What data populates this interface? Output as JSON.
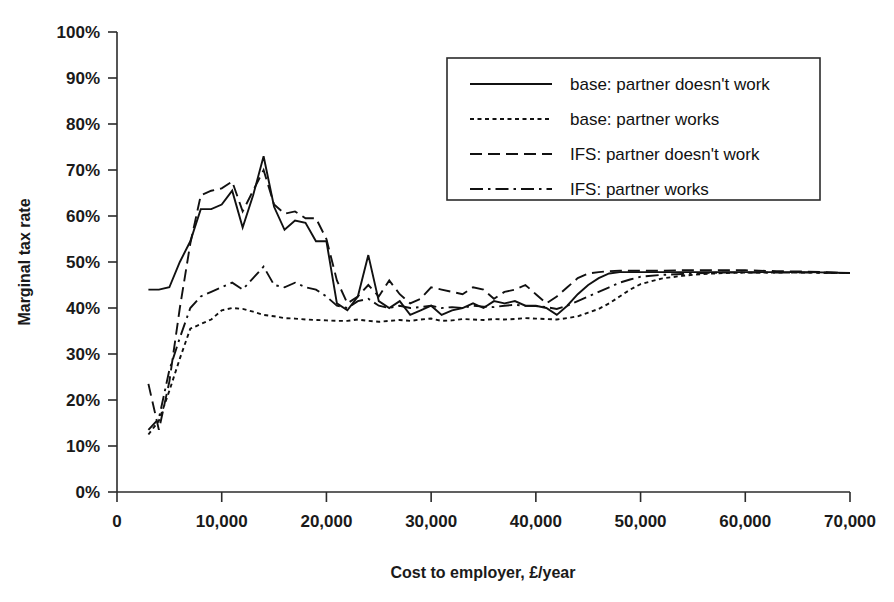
{
  "chart_data": {
    "type": "line",
    "title": "",
    "xlabel": "Cost to employer, £/year",
    "ylabel": "Marginal tax rate",
    "xlim": [
      0,
      70000
    ],
    "ylim": [
      0,
      1.0
    ],
    "grid": false,
    "legend_position": "top-right",
    "x_ticks": [
      0,
      10000,
      20000,
      30000,
      40000,
      50000,
      60000,
      70000
    ],
    "x_tick_labels": [
      "0",
      "10,000",
      "20,000",
      "30,000",
      "40,000",
      "50,000",
      "60,000",
      "70,000"
    ],
    "y_ticks": [
      0,
      0.1,
      0.2,
      0.3,
      0.4,
      0.5,
      0.6,
      0.7,
      0.8,
      0.9,
      1.0
    ],
    "y_tick_labels": [
      "0%",
      "10%",
      "20%",
      "30%",
      "40%",
      "50%",
      "60%",
      "70%",
      "80%",
      "90%",
      "100%"
    ],
    "series": [
      {
        "name": "base: partner doesn't work",
        "dash": "solid",
        "x": [
          3000,
          4000,
          5000,
          6000,
          7000,
          8000,
          9000,
          10000,
          11000,
          12000,
          13000,
          14000,
          15000,
          16000,
          17000,
          18000,
          19000,
          20000,
          21000,
          22000,
          23000,
          24000,
          25000,
          26000,
          27000,
          28000,
          29000,
          30000,
          31000,
          32000,
          33000,
          34000,
          35000,
          36000,
          37000,
          38000,
          39000,
          40000,
          41000,
          42000,
          43000,
          44000,
          45000,
          46000,
          47000,
          48000,
          49000,
          50000,
          52000,
          54000,
          56000,
          58000,
          60000,
          63000,
          66000,
          70000
        ],
        "y": [
          0.44,
          0.44,
          0.445,
          0.5,
          0.545,
          0.615,
          0.615,
          0.625,
          0.655,
          0.575,
          0.645,
          0.73,
          0.62,
          0.57,
          0.59,
          0.585,
          0.545,
          0.545,
          0.41,
          0.395,
          0.425,
          0.515,
          0.415,
          0.4,
          0.415,
          0.385,
          0.395,
          0.405,
          0.385,
          0.395,
          0.4,
          0.41,
          0.4,
          0.415,
          0.41,
          0.415,
          0.405,
          0.405,
          0.4,
          0.385,
          0.405,
          0.43,
          0.45,
          0.465,
          0.475,
          0.478,
          0.478,
          0.478,
          0.478,
          0.478,
          0.478,
          0.478,
          0.478,
          0.478,
          0.478,
          0.476
        ]
      },
      {
        "name": "base: partner works",
        "dash": "dotted",
        "x": [
          3000,
          4000,
          5000,
          6000,
          7000,
          8000,
          9000,
          10000,
          11000,
          12000,
          13000,
          14000,
          15000,
          16000,
          17000,
          18000,
          19000,
          20000,
          21000,
          22000,
          23000,
          24000,
          25000,
          26000,
          27000,
          28000,
          29000,
          30000,
          31000,
          32000,
          33000,
          34000,
          35000,
          36000,
          37000,
          38000,
          39000,
          40000,
          41000,
          42000,
          43000,
          44000,
          45000,
          46000,
          47000,
          48000,
          49000,
          50000,
          52000,
          54000,
          56000,
          58000,
          60000,
          63000,
          66000,
          70000
        ],
        "y": [
          0.125,
          0.155,
          0.22,
          0.29,
          0.355,
          0.365,
          0.375,
          0.395,
          0.4,
          0.398,
          0.392,
          0.385,
          0.382,
          0.378,
          0.377,
          0.375,
          0.374,
          0.373,
          0.372,
          0.372,
          0.375,
          0.372,
          0.37,
          0.372,
          0.374,
          0.372,
          0.375,
          0.377,
          0.372,
          0.373,
          0.376,
          0.375,
          0.374,
          0.376,
          0.375,
          0.376,
          0.378,
          0.377,
          0.376,
          0.375,
          0.378,
          0.382,
          0.39,
          0.398,
          0.41,
          0.425,
          0.44,
          0.452,
          0.464,
          0.47,
          0.474,
          0.476,
          0.477,
          0.477,
          0.477,
          0.476
        ]
      },
      {
        "name": "IFS: partner doesn't work",
        "dash": "dashed",
        "x": [
          3000,
          4000,
          5000,
          6000,
          7000,
          8000,
          9000,
          10000,
          11000,
          12000,
          13000,
          14000,
          15000,
          16000,
          17000,
          18000,
          19000,
          20000,
          21000,
          22000,
          23000,
          24000,
          25000,
          26000,
          27000,
          28000,
          29000,
          30000,
          31000,
          32000,
          33000,
          34000,
          35000,
          36000,
          37000,
          38000,
          39000,
          40000,
          41000,
          42000,
          43000,
          44000,
          45000,
          46000,
          47000,
          48000,
          49000,
          50000,
          52000,
          54000,
          56000,
          58000,
          60000,
          63000,
          66000,
          70000
        ],
        "y": [
          0.235,
          0.135,
          0.24,
          0.4,
          0.54,
          0.645,
          0.655,
          0.66,
          0.675,
          0.61,
          0.655,
          0.7,
          0.625,
          0.605,
          0.61,
          0.595,
          0.595,
          0.55,
          0.46,
          0.41,
          0.425,
          0.45,
          0.425,
          0.46,
          0.43,
          0.41,
          0.42,
          0.445,
          0.44,
          0.435,
          0.43,
          0.445,
          0.44,
          0.42,
          0.435,
          0.44,
          0.45,
          0.43,
          0.41,
          0.425,
          0.445,
          0.465,
          0.475,
          0.478,
          0.48,
          0.481,
          0.481,
          0.481,
          0.481,
          0.482,
          0.482,
          0.482,
          0.482,
          0.48,
          0.479,
          0.476
        ]
      },
      {
        "name": "IFS: partner works",
        "dash": "dashdot",
        "x": [
          3000,
          4000,
          5000,
          6000,
          7000,
          8000,
          9000,
          10000,
          11000,
          12000,
          13000,
          14000,
          15000,
          16000,
          17000,
          18000,
          19000,
          20000,
          21000,
          22000,
          23000,
          24000,
          25000,
          26000,
          27000,
          28000,
          29000,
          30000,
          31000,
          32000,
          33000,
          34000,
          35000,
          36000,
          37000,
          38000,
          39000,
          40000,
          41000,
          42000,
          43000,
          44000,
          45000,
          46000,
          47000,
          48000,
          49000,
          50000,
          52000,
          54000,
          56000,
          58000,
          60000,
          63000,
          66000,
          70000
        ],
        "y": [
          0.135,
          0.16,
          0.265,
          0.335,
          0.4,
          0.425,
          0.435,
          0.445,
          0.455,
          0.44,
          0.465,
          0.49,
          0.45,
          0.445,
          0.455,
          0.445,
          0.44,
          0.425,
          0.405,
          0.4,
          0.415,
          0.42,
          0.405,
          0.4,
          0.405,
          0.4,
          0.402,
          0.405,
          0.4,
          0.402,
          0.4,
          0.405,
          0.403,
          0.402,
          0.405,
          0.407,
          0.405,
          0.404,
          0.402,
          0.398,
          0.405,
          0.415,
          0.425,
          0.435,
          0.445,
          0.455,
          0.462,
          0.468,
          0.472,
          0.474,
          0.476,
          0.477,
          0.477,
          0.477,
          0.477,
          0.476
        ]
      }
    ]
  },
  "legend": {
    "items": [
      {
        "label": "base: partner doesn't work",
        "dash": "solid"
      },
      {
        "label": "base: partner works",
        "dash": "dotted"
      },
      {
        "label": "IFS: partner doesn't work",
        "dash": "dashed"
      },
      {
        "label": "IFS: partner works",
        "dash": "dashdot"
      }
    ]
  },
  "colors": {
    "line": "#111111",
    "axis": "#2b2b2b",
    "text": "#1a1a1a",
    "background": "#ffffff"
  }
}
